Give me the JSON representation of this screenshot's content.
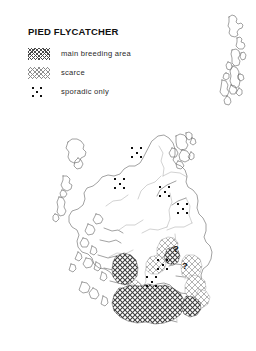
{
  "map": {
    "title": "PIED FLYCATCHER",
    "region_name": "Scotland",
    "legend": {
      "items": [
        {
          "key": "main",
          "label": "main breeding area",
          "swatch": "dense-crosshatch",
          "color": "#4a4a4a"
        },
        {
          "key": "scarce",
          "label": "scarce",
          "swatch": "light-crosshatch",
          "color": "#8d8d8d"
        },
        {
          "key": "sporadic",
          "label": "sporadic only",
          "swatch": "dot-cluster",
          "color": "#111111"
        }
      ]
    },
    "query_marks": [
      {
        "label": "?",
        "x": 176,
        "y": 249
      },
      {
        "label": "?",
        "x": 185,
        "y": 266
      }
    ],
    "sporadic_clusters": [
      {
        "name": "caithness-sutherland",
        "x": 137,
        "y": 153
      },
      {
        "name": "wester-ross",
        "x": 120,
        "y": 184
      },
      {
        "name": "moray",
        "x": 165,
        "y": 192
      },
      {
        "name": "aberdeenshire",
        "x": 183,
        "y": 209
      },
      {
        "name": "fife-lothian",
        "x": 163,
        "y": 265
      },
      {
        "name": "stirling-clyde",
        "x": 152,
        "y": 282
      }
    ],
    "colors": {
      "coastline": "#555555",
      "boundary": "#8a8a8a",
      "main_breeding": "#4a4a4a",
      "scarce": "#8d8d8d",
      "background": "#ffffff"
    }
  }
}
